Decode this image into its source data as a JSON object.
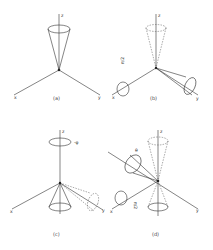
{
  "figure": {
    "panels": [
      {
        "id": "a",
        "label": "(a)",
        "axes": {
          "x": "x",
          "y": "y",
          "z": "z"
        },
        "cone": "along +z"
      },
      {
        "id": "b",
        "label": "(b)",
        "axes": {
          "x": "x",
          "y": "y",
          "z": "z"
        },
        "rotation_label": "π/2",
        "cone": "rotated from z toward y"
      },
      {
        "id": "c",
        "label": "(c)",
        "axes": {
          "x": "x",
          "y": "y",
          "z": "z"
        },
        "rotation_label": "-φ",
        "cone": "along -z"
      },
      {
        "id": "d",
        "label": "(d)",
        "axes": {
          "x": "x",
          "y": "y",
          "z": "z"
        },
        "angle_label": "θ",
        "rotation_label": "π/2",
        "cone": "tilted"
      }
    ],
    "caption": ""
  },
  "colors": {
    "line": "#333333",
    "background": "#ffffff"
  }
}
